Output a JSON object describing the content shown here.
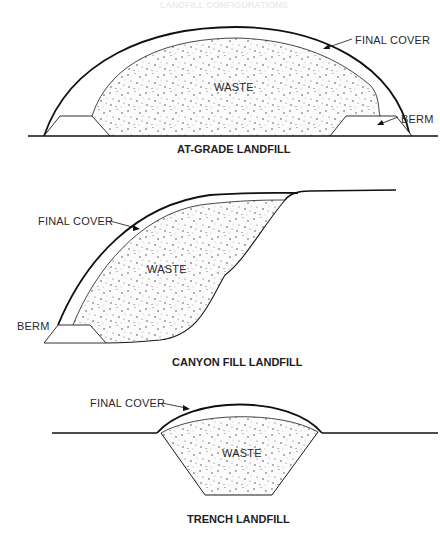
{
  "header": {
    "faint_title": "LANDFILL CONFIGURATIONS"
  },
  "diagrams": [
    {
      "id": "at-grade",
      "caption": "AT-GRADE LANDFILL",
      "labels": {
        "cover": "FINAL COVER",
        "waste": "WASTE",
        "berm": "BERM"
      }
    },
    {
      "id": "canyon-fill",
      "caption": "CANYON FILL LANDFILL",
      "labels": {
        "cover": "FINAL COVER",
        "waste": "WASTE",
        "berm": "BERM"
      }
    },
    {
      "id": "trench",
      "caption": "TRENCH LANDFILL",
      "labels": {
        "cover": "FINAL COVER",
        "waste": "WASTE"
      }
    }
  ],
  "colors": {
    "line": "#1a1a1a",
    "waste_fill": "#f7f7f7",
    "stipple": "#333333"
  }
}
